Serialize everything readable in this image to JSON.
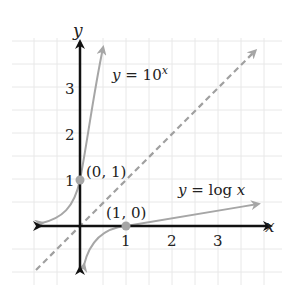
{
  "diagram": {
    "axes": {
      "x_label": "x",
      "y_label": "y"
    },
    "x_ticks": [
      "1",
      "2",
      "3"
    ],
    "y_ticks": [
      "1",
      "2",
      "3"
    ],
    "curves": [
      {
        "name": "exponential",
        "label_prefix": "y = 10",
        "label_exp": "x"
      },
      {
        "name": "logarithm",
        "label": "y = log x"
      },
      {
        "name": "identity",
        "label": "y = x"
      }
    ],
    "points": [
      {
        "label": "(0, 1)"
      },
      {
        "label": "(1, 0)"
      }
    ],
    "colors": {
      "axis": "#111111",
      "curve": "#a6a6a6",
      "grid": "#e6e6e6",
      "dashed": "#a0a0a0"
    }
  }
}
